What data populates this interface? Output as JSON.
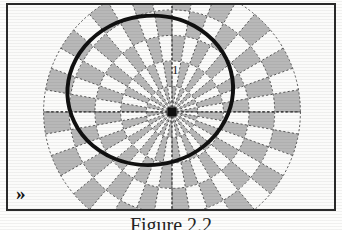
{
  "figure": {
    "caption": "Figure 2.2",
    "corner_mark": "»",
    "corner_mark_name": "double-chevron-mark",
    "frame_color": "#2a2a2a",
    "background_color": "#f2f1ef"
  },
  "chart_data": {
    "type": "polar-checkerboard",
    "title": "",
    "subtitle": "",
    "xlabel": "",
    "ylabel": "",
    "grid": true,
    "legend": false,
    "center": {
      "x": 172,
      "y": 112
    },
    "radial": {
      "tick_labels": [
        "1"
      ],
      "tick_values": [
        1
      ],
      "label_radius_px": 52,
      "ring_count": 5,
      "ring_radii_px": [
        26,
        52,
        78,
        104,
        130
      ],
      "rmax": 5
    },
    "angular": {
      "spoke_count": 36,
      "spoke_step_degrees": 10,
      "axis_lines_degrees": [
        0,
        90,
        180,
        270
      ]
    },
    "cells": {
      "light_color": "#fbfbfa",
      "dark_color": "#b8b8b8",
      "edge_color": "#454545",
      "pattern": "alternating by ring parity and sector parity"
    },
    "contour": {
      "name": "bold-ellipse-curve",
      "shape": "ellipse",
      "color": "#111111",
      "line_width_px": 4,
      "center": {
        "x": 150,
        "y": 90
      },
      "semi_axis_x_px": 84,
      "semi_axis_y_px": 76,
      "rotation_degrees": -8,
      "closed": true
    },
    "origin_marker": {
      "name": "origin-dot",
      "color": "#101010",
      "size_px": 9
    }
  }
}
